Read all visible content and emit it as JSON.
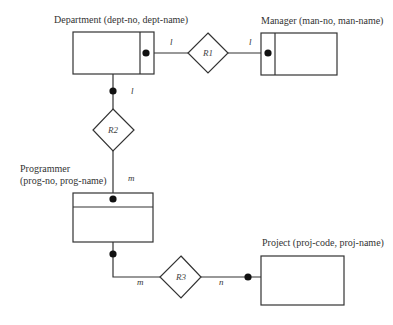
{
  "diagram": {
    "type": "ER diagram",
    "entities": [
      {
        "id": "department",
        "label": "Department (dept-no, dept-name)"
      },
      {
        "id": "manager",
        "label": "Manager (man-no, man-name)"
      },
      {
        "id": "programmer",
        "label_line1": "Programmer",
        "label_line2": "(prog-no, prog-name)"
      },
      {
        "id": "project",
        "label": "Project (proj-code, proj-name)"
      }
    ],
    "relationships": [
      {
        "id": "R1",
        "label": "R1",
        "between": [
          "Department",
          "Manager"
        ],
        "cardinality": [
          "l",
          "l"
        ]
      },
      {
        "id": "R2",
        "label": "R2",
        "between": [
          "Department",
          "Programmer"
        ],
        "cardinality": [
          "l",
          "m"
        ]
      },
      {
        "id": "R3",
        "label": "R3",
        "between": [
          "Programmer",
          "Project"
        ],
        "cardinality": [
          "m",
          "n"
        ]
      }
    ]
  }
}
